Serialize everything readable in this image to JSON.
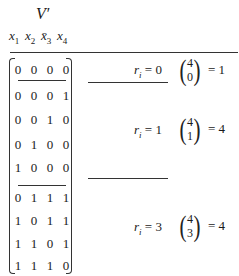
{
  "title": "V′",
  "headers": [
    {
      "var": "x",
      "sub": "1",
      "bar": false
    },
    {
      "var": "x",
      "sub": "2",
      "bar": false
    },
    {
      "var": "x̄",
      "sub": "3",
      "bar": true
    },
    {
      "var": "x",
      "sub": "4",
      "bar": false
    }
  ],
  "groups": [
    {
      "rows": [
        [
          "0",
          "0",
          "0",
          "0"
        ]
      ],
      "label": {
        "var": "r",
        "sub": "i",
        "value": "= 0"
      },
      "binom": {
        "n": "4",
        "k": "0",
        "result": "= 1"
      }
    },
    {
      "rows": [
        [
          "0",
          "0",
          "0",
          "1"
        ],
        [
          "0",
          "0",
          "1",
          "0"
        ],
        [
          "0",
          "1",
          "0",
          "0"
        ],
        [
          "1",
          "0",
          "0",
          "0"
        ]
      ],
      "label": {
        "var": "r",
        "sub": "i",
        "value": "= 1"
      },
      "binom": {
        "n": "4",
        "k": "1",
        "result": "= 4"
      }
    },
    {
      "rows": [
        [
          "0",
          "1",
          "1",
          "1"
        ],
        [
          "1",
          "0",
          "1",
          "1"
        ],
        [
          "1",
          "1",
          "0",
          "1"
        ],
        [
          "1",
          "1",
          "1",
          "0"
        ]
      ],
      "label": {
        "var": "r",
        "sub": "i",
        "value": "= 3"
      },
      "binom": {
        "n": "4",
        "k": "3",
        "result": "= 4"
      }
    }
  ]
}
